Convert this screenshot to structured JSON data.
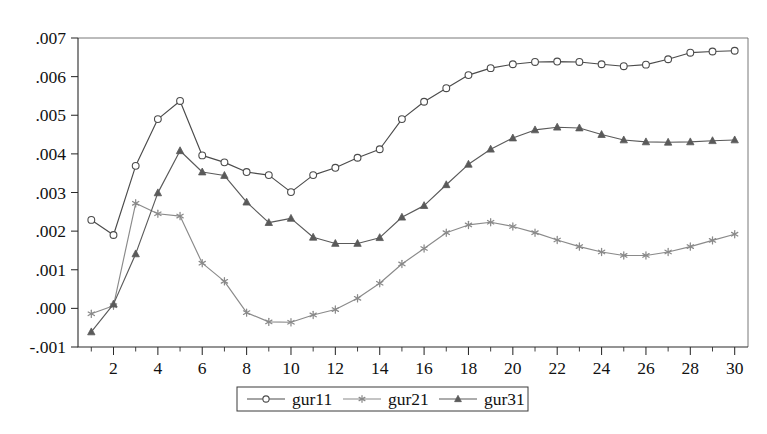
{
  "chart_data": {
    "type": "line",
    "title": "",
    "subtitle": "",
    "xlabel": "",
    "ylabel": "",
    "xlim": [
      0.4,
      30.6
    ],
    "ylim": [
      -0.001,
      0.007
    ],
    "grid": false,
    "legend_position": "bottom-center",
    "x": [
      1,
      2,
      3,
      4,
      5,
      6,
      7,
      8,
      9,
      10,
      11,
      12,
      13,
      14,
      15,
      16,
      17,
      18,
      19,
      20,
      21,
      22,
      23,
      24,
      25,
      26,
      27,
      28,
      29,
      30
    ],
    "xticks": [
      2,
      4,
      6,
      8,
      10,
      12,
      14,
      16,
      18,
      20,
      22,
      24,
      26,
      28,
      30
    ],
    "xtick_labels": [
      "2",
      "4",
      "6",
      "8",
      "10",
      "12",
      "14",
      "16",
      "18",
      "20",
      "22",
      "24",
      "26",
      "28",
      "30"
    ],
    "xticks_minor": [
      1,
      3,
      5,
      7,
      9,
      11,
      13,
      15,
      17,
      19,
      21,
      23,
      25,
      27,
      29
    ],
    "yticks": [
      -0.001,
      0.0,
      0.001,
      0.002,
      0.003,
      0.004,
      0.005,
      0.006,
      0.007
    ],
    "ytick_labels": [
      "-.001",
      ".000",
      ".001",
      ".002",
      ".003",
      ".004",
      ".005",
      ".006",
      ".007"
    ],
    "series": [
      {
        "name": "gur11",
        "marker": "open-circle",
        "color": "#4b4b4b",
        "values": [
          0.00229,
          0.0019,
          0.00369,
          0.0049,
          0.00537,
          0.00396,
          0.00378,
          0.00353,
          0.00345,
          0.00301,
          0.00345,
          0.00364,
          0.0039,
          0.00412,
          0.0049,
          0.00535,
          0.0057,
          0.00604,
          0.00622,
          0.00632,
          0.00638,
          0.00639,
          0.00638,
          0.00632,
          0.00627,
          0.00631,
          0.00645,
          0.00662,
          0.00665,
          0.00667
        ]
      },
      {
        "name": "gur21",
        "marker": "asterisk",
        "color": "#8a8a8a",
        "values": [
          -0.00014,
          7e-05,
          0.00272,
          0.00245,
          0.00239,
          0.00117,
          0.0007,
          -0.00011,
          -0.00035,
          -0.00036,
          -0.00017,
          -3e-05,
          0.00026,
          0.00065,
          0.00115,
          0.00155,
          0.00196,
          0.00216,
          0.00223,
          0.00212,
          0.00196,
          0.00177,
          0.0016,
          0.00146,
          0.00137,
          0.00137,
          0.00146,
          0.0016,
          0.00176,
          0.00192
        ]
      },
      {
        "name": "gur31",
        "marker": "filled-triangle",
        "color": "#5a5a5a",
        "values": [
          -0.00061,
          0.00011,
          0.00141,
          0.00299,
          0.00408,
          0.00353,
          0.00344,
          0.00275,
          0.00222,
          0.00233,
          0.00184,
          0.00168,
          0.00168,
          0.00183,
          0.00236,
          0.00266,
          0.0032,
          0.00373,
          0.00412,
          0.00441,
          0.00462,
          0.00469,
          0.00467,
          0.0045,
          0.00436,
          0.00431,
          0.0043,
          0.00431,
          0.00434,
          0.00436
        ]
      }
    ]
  },
  "legend": {
    "entries": [
      {
        "label": "gur11"
      },
      {
        "label": "gur21"
      },
      {
        "label": "gur31"
      }
    ]
  }
}
